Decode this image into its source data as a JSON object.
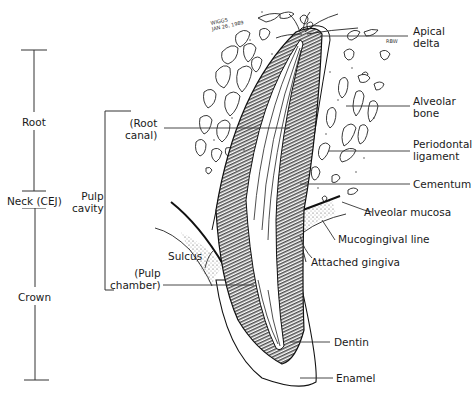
{
  "diagram": {
    "signature": {
      "line1": "WIGGS",
      "line2": "JAN 26, 1989"
    },
    "initials": "RBW",
    "left_scale": [
      {
        "id": "root",
        "label": "Root"
      },
      {
        "id": "neck",
        "label": "Neck (CEJ)"
      },
      {
        "id": "crown",
        "label": "Crown"
      }
    ],
    "pulp_bracket": {
      "label_line1": "Pulp",
      "label_line2": "cavity",
      "items": [
        {
          "id": "root-canal",
          "line1": "(Root",
          "line2": "canal)"
        },
        {
          "id": "pulp-chamber",
          "line1": "(Pulp",
          "line2": "chamber)"
        }
      ]
    },
    "left_labels": [
      {
        "id": "sulcus",
        "label": "Sulcus"
      }
    ],
    "right_labels": [
      {
        "id": "apical-delta",
        "line1": "Apical",
        "line2": "delta"
      },
      {
        "id": "alveolar-bone",
        "line1": "Alveolar",
        "line2": "bone"
      },
      {
        "id": "periodontal-ligament",
        "line1": "Periodontal",
        "line2": "ligament"
      },
      {
        "id": "cementum",
        "line1": "Cementum"
      },
      {
        "id": "alveolar-mucosa",
        "line1": "Alveolar mucosa"
      },
      {
        "id": "mucogingival-line",
        "line1": "Mucogingival line"
      },
      {
        "id": "attached-gingiva",
        "line1": "Attached gingiva"
      },
      {
        "id": "dentin",
        "line1": "Dentin"
      },
      {
        "id": "enamel",
        "line1": "Enamel"
      }
    ],
    "colors": {
      "ink": "#1a1a1a",
      "paper": "#ffffff",
      "hatch": "#2b2b2b"
    }
  }
}
